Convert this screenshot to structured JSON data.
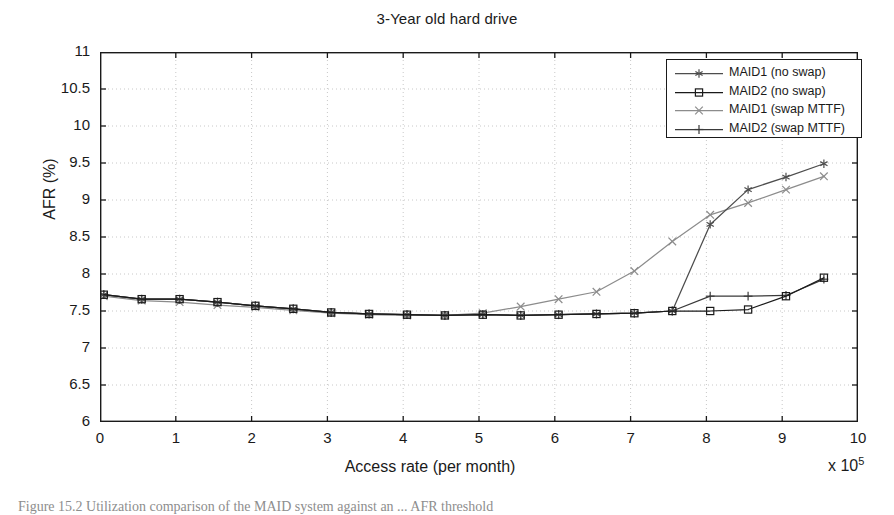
{
  "figure": {
    "title": "3-Year old hard drive",
    "caption": "Figure 15.2   Utilization comparison of the MAID system against an ... AFR threshold"
  },
  "chart_data": {
    "type": "line",
    "title": "3-Year old hard drive",
    "xlabel": "Access rate (per month)",
    "ylabel": "AFR (%)",
    "x_multiplier": "x 10",
    "x_multiplier_exponent": "5",
    "xlim": [
      0,
      10
    ],
    "ylim": [
      6,
      11
    ],
    "xticks": [
      0,
      1,
      2,
      3,
      4,
      5,
      6,
      7,
      8,
      9,
      10
    ],
    "yticks": [
      6,
      6.5,
      7,
      7.5,
      8,
      8.5,
      9,
      9.5,
      10,
      10.5,
      11
    ],
    "xtick_labels": [
      "0",
      "1",
      "2",
      "3",
      "4",
      "5",
      "6",
      "7",
      "8",
      "9",
      "10"
    ],
    "ytick_labels": [
      "6",
      "6.5",
      "7",
      "7.5",
      "8",
      "8.5",
      "9",
      "9.5",
      "10",
      "10.5",
      "11"
    ],
    "grid": true,
    "grid_style": "dotted",
    "legend_position": "upper right",
    "x": [
      0.05,
      0.55,
      1.05,
      1.55,
      2.05,
      2.55,
      3.05,
      3.55,
      4.05,
      4.55,
      5.05,
      5.55,
      6.05,
      6.55,
      7.05,
      7.55,
      8.05,
      8.55,
      9.05,
      9.55
    ],
    "series": [
      {
        "name": "MAID1 (no swap)",
        "marker": "asterisk",
        "color": "#4d4d4d",
        "values": [
          7.72,
          7.66,
          7.66,
          7.62,
          7.57,
          7.53,
          7.48,
          7.46,
          7.45,
          7.44,
          7.45,
          7.44,
          7.45,
          7.46,
          7.47,
          7.5,
          8.67,
          9.14,
          9.31,
          9.49
        ]
      },
      {
        "name": "MAID2 (no swap)",
        "marker": "square",
        "color": "#1a1a1a",
        "values": [
          7.72,
          7.66,
          7.66,
          7.62,
          7.57,
          7.53,
          7.48,
          7.46,
          7.45,
          7.44,
          7.45,
          7.44,
          7.45,
          7.46,
          7.47,
          7.5,
          7.5,
          7.52,
          7.7,
          7.95
        ]
      },
      {
        "name": "MAID1 (swap MTTF)",
        "marker": "x",
        "color": "#8c8c8c",
        "values": [
          7.7,
          7.64,
          7.62,
          7.58,
          7.55,
          7.51,
          7.47,
          7.45,
          7.44,
          7.44,
          7.47,
          7.56,
          7.66,
          7.76,
          8.04,
          8.44,
          8.8,
          8.96,
          9.14,
          9.32
        ]
      },
      {
        "name": "MAID2 (swap MTTF)",
        "marker": "plus",
        "color": "#3a3a3a",
        "values": [
          7.72,
          7.66,
          7.66,
          7.62,
          7.57,
          7.53,
          7.48,
          7.46,
          7.45,
          7.44,
          7.45,
          7.44,
          7.45,
          7.46,
          7.47,
          7.5,
          7.7,
          7.7,
          7.71,
          7.93
        ]
      }
    ]
  },
  "legend": {
    "items": [
      {
        "label": "MAID1 (no swap)",
        "marker": "asterisk-marker-icon"
      },
      {
        "label": "MAID2 (no swap)",
        "marker": "square-marker-icon"
      },
      {
        "label": "MAID1 (swap MTTF)",
        "marker": "x-marker-icon"
      },
      {
        "label": "MAID2 (swap MTTF)",
        "marker": "plus-marker-icon"
      }
    ]
  }
}
